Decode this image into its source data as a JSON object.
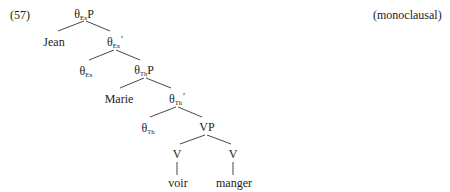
{
  "example": {
    "number": "(57)",
    "annotation": "(monoclausal)"
  },
  "tree": {
    "theta_symbol": "θ",
    "nodes": [
      {
        "id": "thetaExP",
        "base": "θ",
        "sub": "Ex",
        "suffix": "P",
        "x": 84,
        "y": 8
      },
      {
        "id": "jean",
        "text": "Jean",
        "x": 54,
        "y": 36
      },
      {
        "id": "thetaExBar",
        "base": "θ",
        "sub": "Ex",
        "suffix": "′",
        "x": 115,
        "y": 36
      },
      {
        "id": "thetaEx",
        "base": "θ",
        "sub": "Ex",
        "suffix": "",
        "x": 86,
        "y": 65
      },
      {
        "id": "thetaThP",
        "base": "θ",
        "sub": "Th",
        "suffix": "P",
        "x": 144,
        "y": 64
      },
      {
        "id": "marie",
        "text": "Marie",
        "x": 119,
        "y": 93
      },
      {
        "id": "thetaThBar",
        "base": "θ",
        "sub": "Th",
        "suffix": "′",
        "x": 177,
        "y": 93
      },
      {
        "id": "thetaTh",
        "base": "θ",
        "sub": "Th",
        "suffix": "",
        "x": 148,
        "y": 122
      },
      {
        "id": "VP",
        "text": "VP",
        "x": 207,
        "y": 121
      },
      {
        "id": "V1",
        "text": "V",
        "x": 177,
        "y": 148
      },
      {
        "id": "V2",
        "text": "V",
        "x": 233,
        "y": 148
      },
      {
        "id": "voir",
        "text": "voir",
        "x": 178,
        "y": 177
      },
      {
        "id": "manger",
        "text": "manger",
        "x": 234,
        "y": 177
      }
    ],
    "edges": [
      {
        "from": "thetaExP",
        "to": "jean",
        "x1": 84,
        "y1": 21,
        "x2": 58,
        "y2": 31
      },
      {
        "from": "thetaExP",
        "to": "thetaExBar",
        "x1": 86,
        "y1": 21,
        "x2": 110,
        "y2": 31
      },
      {
        "from": "thetaExBar",
        "to": "thetaEx",
        "x1": 114,
        "y1": 50,
        "x2": 89,
        "y2": 60
      },
      {
        "from": "thetaExBar",
        "to": "thetaThP",
        "x1": 116,
        "y1": 50,
        "x2": 140,
        "y2": 60
      },
      {
        "from": "thetaThP",
        "to": "marie",
        "x1": 144,
        "y1": 78,
        "x2": 120,
        "y2": 88
      },
      {
        "from": "thetaThP",
        "to": "thetaThBar",
        "x1": 146,
        "y1": 78,
        "x2": 171,
        "y2": 88
      },
      {
        "from": "thetaThBar",
        "to": "thetaTh",
        "x1": 176,
        "y1": 107,
        "x2": 150,
        "y2": 117
      },
      {
        "from": "thetaThBar",
        "to": "VP",
        "x1": 178,
        "y1": 107,
        "x2": 202,
        "y2": 117
      },
      {
        "from": "VP",
        "to": "V1",
        "x1": 205,
        "y1": 135,
        "x2": 180,
        "y2": 144
      },
      {
        "from": "VP",
        "to": "V2",
        "x1": 207,
        "y1": 135,
        "x2": 231,
        "y2": 144
      },
      {
        "from": "V1",
        "to": "voir",
        "x1": 177,
        "y1": 162,
        "x2": 177,
        "y2": 175
      },
      {
        "from": "V2",
        "to": "manger",
        "x1": 233,
        "y1": 162,
        "x2": 233,
        "y2": 175
      }
    ]
  }
}
